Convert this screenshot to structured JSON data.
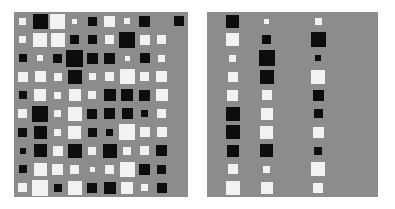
{
  "figure": {
    "background": "#ffffff",
    "panel_background": "#8c8c8c",
    "dark_color": "#0d0d0d",
    "light_color": "#f2f2f2",
    "width": 395,
    "height": 209
  },
  "panels": [
    {
      "name": "left-panel",
      "x": 14,
      "y": 12,
      "width": 174,
      "height": 185,
      "rows": 10,
      "cols": 10
    },
    {
      "name": "right-panel",
      "x": 207,
      "y": 12,
      "width": 171,
      "height": 185,
      "rows": 10,
      "cols": 10
    }
  ],
  "chart_data": {
    "type": "heatmap",
    "title": "",
    "subtitle": "",
    "xlabel": "",
    "ylabel": "",
    "legend": [],
    "grid": false,
    "encoding": {
      "color_negative": "#0d0d0d",
      "color_positive": "#f2f2f2",
      "background": "#8c8c8c",
      "size_encodes": "magnitude",
      "max_glyph_px": 20,
      "value_range": [
        -1,
        1
      ]
    },
    "matrices": [
      {
        "name": "left-matrix",
        "rows": 10,
        "cols": 10,
        "cells": [
          [
            0.18,
            -0.8,
            0.78,
            0.1,
            -0.28,
            0.4,
            0.14,
            -0.4,
            0.0,
            -0.35
          ],
          [
            0.16,
            0.72,
            0.66,
            -0.26,
            -0.3,
            0.28,
            -0.86,
            0.34,
            0.3,
            0.0
          ],
          [
            -0.22,
            0.14,
            -0.3,
            -0.95,
            -0.38,
            -0.42,
            0.1,
            -0.32,
            0.16,
            0.0
          ],
          [
            0.32,
            0.4,
            0.24,
            -0.7,
            0.16,
            0.26,
            0.8,
            0.3,
            0.38,
            0.0
          ],
          [
            -0.2,
            0.52,
            0.18,
            0.46,
            0.22,
            -0.48,
            -0.52,
            -0.44,
            0.46,
            0.0
          ],
          [
            0.26,
            -0.84,
            0.18,
            0.66,
            -0.32,
            -0.42,
            -0.4,
            -0.16,
            0.26,
            0.0
          ],
          [
            -0.3,
            -0.56,
            0.16,
            0.62,
            -0.26,
            -0.18,
            0.84,
            0.34,
            0.32,
            0.0
          ],
          [
            -0.14,
            -0.58,
            0.36,
            -0.7,
            0.24,
            -0.66,
            0.24,
            0.3,
            -0.38,
            0.0
          ],
          [
            -0.24,
            0.54,
            0.4,
            0.3,
            0.08,
            0.3,
            0.76,
            -0.44,
            -0.3,
            0.0
          ],
          [
            0.28,
            0.9,
            -0.22,
            0.66,
            -0.32,
            -0.48,
            0.46,
            0.18,
            -0.32,
            0.0
          ]
        ]
      },
      {
        "name": "right-matrix",
        "rows": 10,
        "cols": 10,
        "cells": [
          [
            0.0,
            -0.62,
            0.0,
            0.1,
            0.0,
            0.0,
            0.18,
            0.0,
            0.0,
            0.0
          ],
          [
            0.0,
            0.6,
            0.0,
            -0.26,
            0.0,
            0.0,
            -0.76,
            0.0,
            0.0,
            0.0
          ],
          [
            0.0,
            0.16,
            0.0,
            -0.88,
            0.0,
            0.0,
            -0.14,
            0.0,
            0.0,
            0.0
          ],
          [
            0.0,
            0.38,
            0.0,
            -0.68,
            0.0,
            0.0,
            0.72,
            0.0,
            0.0,
            0.0
          ],
          [
            0.0,
            0.46,
            0.0,
            0.34,
            0.0,
            0.0,
            -0.4,
            0.0,
            0.0,
            0.0
          ],
          [
            0.0,
            -0.68,
            0.0,
            0.52,
            0.0,
            0.0,
            -0.3,
            0.0,
            0.0,
            0.0
          ],
          [
            0.0,
            -0.74,
            0.0,
            0.58,
            0.0,
            0.0,
            0.44,
            0.0,
            0.0,
            0.0
          ],
          [
            0.0,
            -0.52,
            0.0,
            -0.58,
            0.0,
            0.0,
            -0.22,
            0.0,
            0.0,
            0.0
          ],
          [
            0.0,
            0.34,
            0.0,
            0.16,
            0.0,
            0.0,
            0.7,
            0.0,
            0.0,
            0.0
          ],
          [
            0.0,
            0.66,
            0.0,
            0.52,
            0.0,
            0.0,
            0.34,
            0.0,
            0.0,
            0.0
          ]
        ]
      }
    ]
  }
}
